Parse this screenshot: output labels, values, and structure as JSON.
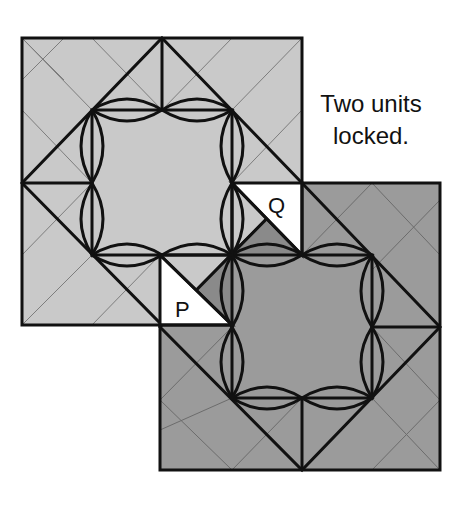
{
  "caption": {
    "line1": "Two units",
    "line2": "locked."
  },
  "labels": {
    "p": "P",
    "q": "Q"
  },
  "colors": {
    "unit1_fill": "#c9c9c9",
    "unit2_fill": "#9b9b9b",
    "overlap_triangle": "#8a8a8a",
    "flap_white": "#ffffff",
    "stroke": "#111111",
    "crease": "#7d7d7d"
  },
  "units": [
    {
      "name": "unit-1",
      "shade": "light",
      "outer": [
        22,
        38,
        302,
        325
      ],
      "inner": [
        92,
        110,
        232,
        255
      ]
    },
    {
      "name": "unit-2",
      "shade": "dark",
      "outer": [
        160,
        183,
        440,
        470
      ],
      "inner": [
        232,
        255,
        372,
        398
      ]
    }
  ]
}
